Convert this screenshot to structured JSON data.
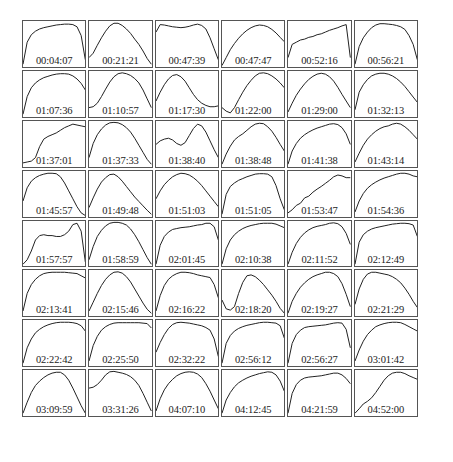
{
  "chart_data": {
    "type": "line",
    "title": "",
    "xlabel": "",
    "ylabel": "",
    "layout": {
      "rows": 8,
      "cols": 6,
      "axes": "hidden",
      "grid": false,
      "legend": "none"
    },
    "panels": [
      {
        "label": "00:04:07",
        "y": [
          0.05,
          0.55,
          0.72,
          0.8,
          0.85,
          0.88,
          0.9,
          0.92,
          0.94,
          0.95,
          0.96,
          0.96,
          0.95,
          0.9,
          0.7,
          0.15
        ]
      },
      {
        "label": "00:21:21",
        "y": [
          0.2,
          0.3,
          0.48,
          0.65,
          0.8,
          0.92,
          0.98,
          0.98,
          0.93,
          0.85,
          0.75,
          0.62,
          0.5,
          0.35,
          0.18,
          0.05
        ]
      },
      {
        "label": "00:47:39",
        "y": [
          0.78,
          0.95,
          0.94,
          0.92,
          0.9,
          0.89,
          0.88,
          0.89,
          0.91,
          0.94,
          0.96,
          0.93,
          0.85,
          0.65,
          0.4,
          0.15
        ]
      },
      {
        "label": "00:47:47",
        "y": [
          0.02,
          0.2,
          0.38,
          0.52,
          0.64,
          0.74,
          0.82,
          0.88,
          0.92,
          0.94,
          0.93,
          0.9,
          0.84,
          0.76,
          0.66,
          0.56
        ]
      },
      {
        "label": "00:52:16",
        "y": [
          0.2,
          0.5,
          0.55,
          0.6,
          0.62,
          0.66,
          0.68,
          0.72,
          0.74,
          0.78,
          0.82,
          0.85,
          0.88,
          0.92,
          0.95,
          0.2
        ]
      },
      {
        "label": "00:56:21",
        "y": [
          0.05,
          0.45,
          0.65,
          0.78,
          0.88,
          0.94,
          0.97,
          0.97,
          0.96,
          0.95,
          0.93,
          0.9,
          0.84,
          0.7,
          0.5,
          0.15
        ]
      },
      {
        "label": "01:07:36",
        "y": [
          0.05,
          0.45,
          0.65,
          0.76,
          0.83,
          0.88,
          0.91,
          0.94,
          0.96,
          0.97,
          0.97,
          0.96,
          0.92,
          0.85,
          0.75,
          0.6
        ]
      },
      {
        "label": "01:10:57",
        "y": [
          0.2,
          0.22,
          0.3,
          0.45,
          0.62,
          0.78,
          0.9,
          0.97,
          0.99,
          0.97,
          0.93,
          0.86,
          0.76,
          0.6,
          0.4,
          0.2
        ]
      },
      {
        "label": "01:17:30",
        "y": [
          0.35,
          0.55,
          0.72,
          0.85,
          0.93,
          0.95,
          0.9,
          0.8,
          0.65,
          0.5,
          0.38,
          0.3,
          0.25,
          0.22,
          0.22,
          0.24
        ]
      },
      {
        "label": "01:22:00",
        "y": [
          0.2,
          0.12,
          0.08,
          0.2,
          0.38,
          0.55,
          0.7,
          0.82,
          0.92,
          0.98,
          0.99,
          0.97,
          0.92,
          0.85,
          0.76,
          0.65
        ]
      },
      {
        "label": "01:29:00",
        "y": [
          0.1,
          0.3,
          0.48,
          0.62,
          0.74,
          0.84,
          0.91,
          0.96,
          0.98,
          0.96,
          0.9,
          0.8,
          0.66,
          0.5,
          0.35,
          0.2
        ]
      },
      {
        "label": "01:32:13",
        "y": [
          0.15,
          0.55,
          0.72,
          0.84,
          0.92,
          0.96,
          0.98,
          0.98,
          0.96,
          0.92,
          0.86,
          0.78,
          0.68,
          0.56,
          0.44,
          0.32
        ]
      },
      {
        "label": "01:37:01",
        "y": [
          0.08,
          0.1,
          0.12,
          0.2,
          0.45,
          0.62,
          0.68,
          0.72,
          0.76,
          0.82,
          0.88,
          0.92,
          0.96,
          0.94,
          0.92,
          0.9
        ]
      },
      {
        "label": "01:37:33",
        "y": [
          0.2,
          0.52,
          0.72,
          0.85,
          0.94,
          0.99,
          1.0,
          0.99,
          0.95,
          0.88,
          0.78,
          0.64,
          0.48,
          0.32,
          0.16,
          0.05
        ]
      },
      {
        "label": "01:38:40",
        "y": [
          0.5,
          0.58,
          0.62,
          0.64,
          0.6,
          0.52,
          0.48,
          0.54,
          0.7,
          0.86,
          0.96,
          0.92,
          0.78,
          0.58,
          0.38,
          0.2
        ]
      },
      {
        "label": "01:38:48",
        "y": [
          0.05,
          0.28,
          0.46,
          0.6,
          0.68,
          0.74,
          0.82,
          0.9,
          0.96,
          0.98,
          0.97,
          0.9,
          0.8,
          0.66,
          0.5,
          0.35
        ]
      },
      {
        "label": "01:41:38",
        "y": [
          0.05,
          0.35,
          0.52,
          0.64,
          0.72,
          0.78,
          0.83,
          0.87,
          0.9,
          0.93,
          0.96,
          0.97,
          0.95,
          0.88,
          0.74,
          0.5
        ]
      },
      {
        "label": "01:43:14",
        "y": [
          0.1,
          0.3,
          0.48,
          0.62,
          0.72,
          0.8,
          0.86,
          0.9,
          0.92,
          0.96,
          0.98,
          0.96,
          0.9,
          0.82,
          0.72,
          0.62
        ]
      },
      {
        "label": "01:45:57",
        "y": [
          0.35,
          0.65,
          0.8,
          0.88,
          0.93,
          0.96,
          0.98,
          0.98,
          0.97,
          0.9,
          0.76,
          0.58,
          0.4,
          0.22,
          0.08,
          0.02
        ]
      },
      {
        "label": "01:49:48",
        "y": [
          0.2,
          0.42,
          0.62,
          0.78,
          0.88,
          0.95,
          0.96,
          0.9,
          0.8,
          0.68,
          0.56,
          0.44,
          0.34,
          0.24,
          0.14,
          0.05
        ]
      },
      {
        "label": "01:51:03",
        "y": [
          0.4,
          0.58,
          0.72,
          0.82,
          0.9,
          0.95,
          0.98,
          0.97,
          0.94,
          0.88,
          0.8,
          0.7,
          0.58,
          0.46,
          0.34,
          0.22
        ]
      },
      {
        "label": "01:51:05",
        "y": [
          0.05,
          0.5,
          0.68,
          0.76,
          0.82,
          0.86,
          0.9,
          0.93,
          0.96,
          0.97,
          0.97,
          0.96,
          0.9,
          0.7,
          0.4,
          0.15
        ]
      },
      {
        "label": "01:53:47",
        "y": [
          0.08,
          0.15,
          0.25,
          0.3,
          0.42,
          0.46,
          0.55,
          0.62,
          0.68,
          0.75,
          0.82,
          0.9,
          0.94,
          0.92,
          0.88,
          0.88
        ]
      },
      {
        "label": "01:54:36",
        "y": [
          0.1,
          0.35,
          0.52,
          0.64,
          0.72,
          0.78,
          0.83,
          0.87,
          0.9,
          0.93,
          0.96,
          0.98,
          0.98,
          0.96,
          0.92,
          0.9
        ]
      },
      {
        "label": "01:57:57",
        "y": [
          0.05,
          0.15,
          0.35,
          0.6,
          0.7,
          0.72,
          0.7,
          0.7,
          0.68,
          0.68,
          0.72,
          0.8,
          0.95,
          0.98,
          0.8,
          0.1
        ]
      },
      {
        "label": "01:58:59",
        "y": [
          0.15,
          0.45,
          0.68,
          0.82,
          0.92,
          0.98,
          1.0,
          1.0,
          0.98,
          0.94,
          0.85,
          0.72,
          0.56,
          0.38,
          0.2,
          0.05
        ]
      },
      {
        "label": "02:01:45",
        "y": [
          0.05,
          0.48,
          0.68,
          0.78,
          0.84,
          0.86,
          0.88,
          0.89,
          0.9,
          0.92,
          0.94,
          0.95,
          0.98,
          0.98,
          0.9,
          0.6
        ]
      },
      {
        "label": "02:10:38",
        "y": [
          0.05,
          0.4,
          0.6,
          0.72,
          0.8,
          0.86,
          0.9,
          0.93,
          0.95,
          0.97,
          0.98,
          0.98,
          0.98,
          0.96,
          0.92,
          0.88
        ]
      },
      {
        "label": "02:11:52",
        "y": [
          0.05,
          0.32,
          0.52,
          0.66,
          0.76,
          0.83,
          0.88,
          0.91,
          0.93,
          0.95,
          0.98,
          0.99,
          0.97,
          0.9,
          0.75,
          0.5
        ]
      },
      {
        "label": "02:12:49",
        "y": [
          0.05,
          0.55,
          0.72,
          0.8,
          0.85,
          0.88,
          0.9,
          0.92,
          0.94,
          0.96,
          0.97,
          0.98,
          0.98,
          0.97,
          0.94,
          0.68
        ]
      },
      {
        "label": "02:13:41",
        "y": [
          0.1,
          0.5,
          0.7,
          0.82,
          0.9,
          0.95,
          0.97,
          0.98,
          0.98,
          0.98,
          0.98,
          0.97,
          0.96,
          0.95,
          0.9,
          0.85
        ]
      },
      {
        "label": "02:15:46",
        "y": [
          0.1,
          0.3,
          0.5,
          0.68,
          0.82,
          0.92,
          0.98,
          0.99,
          0.96,
          0.88,
          0.76,
          0.6,
          0.44,
          0.28,
          0.14,
          0.05
        ]
      },
      {
        "label": "02:16:22",
        "y": [
          0.1,
          0.45,
          0.68,
          0.82,
          0.9,
          0.95,
          0.98,
          0.98,
          0.97,
          0.95,
          0.92,
          0.9,
          0.88,
          0.86,
          0.7,
          0.4
        ]
      },
      {
        "label": "02:18:20",
        "y": [
          0.35,
          0.15,
          0.12,
          0.2,
          0.5,
          0.75,
          0.9,
          0.92,
          0.88,
          0.8,
          0.7,
          0.58,
          0.46,
          0.32,
          0.16,
          0.05
        ]
      },
      {
        "label": "02:19:27",
        "y": [
          0.05,
          0.32,
          0.5,
          0.64,
          0.74,
          0.82,
          0.88,
          0.92,
          0.95,
          0.98,
          0.98,
          0.95,
          0.88,
          0.72,
          0.48,
          0.2
        ]
      },
      {
        "label": "02:21:29",
        "y": [
          0.25,
          0.6,
          0.82,
          0.94,
          0.98,
          0.98,
          0.96,
          0.94,
          0.92,
          0.88,
          0.82,
          0.74,
          0.62,
          0.48,
          0.32,
          0.18
        ]
      },
      {
        "label": "02:22:42",
        "y": [
          0.05,
          0.4,
          0.6,
          0.74,
          0.82,
          0.88,
          0.92,
          0.95,
          0.97,
          0.98,
          0.98,
          0.98,
          0.97,
          0.95,
          0.9,
          0.78
        ]
      },
      {
        "label": "02:25:50",
        "y": [
          0.1,
          0.45,
          0.66,
          0.8,
          0.88,
          0.93,
          0.96,
          0.97,
          0.97,
          0.97,
          0.97,
          0.97,
          0.97,
          0.96,
          0.95,
          0.85
        ]
      },
      {
        "label": "02:32:22",
        "y": [
          0.3,
          0.52,
          0.7,
          0.84,
          0.93,
          0.97,
          0.98,
          0.97,
          0.96,
          0.94,
          0.92,
          0.9,
          0.86,
          0.8,
          0.6,
          0.2
        ]
      },
      {
        "label": "02:56:12",
        "y": [
          0.05,
          0.5,
          0.68,
          0.78,
          0.84,
          0.88,
          0.91,
          0.93,
          0.95,
          0.97,
          0.98,
          0.98,
          0.97,
          0.96,
          0.9,
          0.62
        ]
      },
      {
        "label": "02:56:27",
        "y": [
          0.05,
          0.5,
          0.7,
          0.8,
          0.86,
          0.88,
          0.89,
          0.9,
          0.91,
          0.92,
          0.94,
          0.96,
          0.97,
          0.96,
          0.82,
          0.4
        ]
      },
      {
        "label": "03:01:42",
        "y": [
          0.1,
          0.35,
          0.55,
          0.7,
          0.8,
          0.88,
          0.92,
          0.95,
          0.97,
          0.98,
          0.98,
          0.97,
          0.93,
          0.88,
          0.83,
          0.78
        ]
      },
      {
        "label": "03:09:59",
        "y": [
          0.05,
          0.3,
          0.52,
          0.68,
          0.78,
          0.86,
          0.92,
          0.96,
          0.98,
          0.98,
          0.92,
          0.8,
          0.62,
          0.42,
          0.22,
          0.05
        ]
      },
      {
        "label": "03:31:26",
        "y": [
          0.62,
          0.64,
          0.7,
          0.8,
          0.92,
          0.99,
          1.0,
          0.98,
          0.96,
          0.93,
          0.88,
          0.8,
          0.68,
          0.5,
          0.3,
          0.1
        ]
      },
      {
        "label": "04:07:10",
        "y": [
          0.1,
          0.38,
          0.58,
          0.72,
          0.82,
          0.9,
          0.95,
          0.98,
          0.99,
          0.98,
          0.94,
          0.86,
          0.72,
          0.55,
          0.35,
          0.15
        ]
      },
      {
        "label": "04:12:45",
        "y": [
          0.05,
          0.35,
          0.52,
          0.65,
          0.74,
          0.8,
          0.85,
          0.89,
          0.92,
          0.95,
          0.97,
          0.99,
          0.98,
          0.92,
          0.78,
          0.55
        ]
      },
      {
        "label": "04:21:59",
        "y": [
          0.05,
          0.5,
          0.7,
          0.8,
          0.85,
          0.87,
          0.88,
          0.89,
          0.9,
          0.92,
          0.94,
          0.96,
          0.96,
          0.92,
          0.84,
          0.72
        ]
      },
      {
        "label": "04:52:00",
        "y": [
          0.05,
          0.15,
          0.26,
          0.32,
          0.4,
          0.52,
          0.66,
          0.8,
          0.9,
          0.96,
          0.98,
          0.98,
          0.95,
          0.9,
          0.86,
          0.82
        ]
      }
    ]
  },
  "style": {
    "line_color": "#222222",
    "border_color": "#555555",
    "background": "#ffffff"
  }
}
